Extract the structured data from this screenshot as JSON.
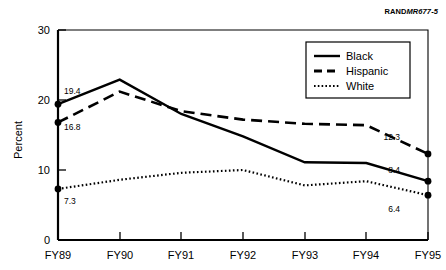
{
  "source_tag": {
    "prefix": "RAND",
    "code": "MR677-5"
  },
  "chart_data": {
    "type": "line",
    "title": "",
    "subtitle": "",
    "xlabel": "",
    "ylabel": "Percent",
    "categories": [
      "FY89",
      "FY90",
      "FY91",
      "FY92",
      "FY93",
      "FY94",
      "FY95"
    ],
    "ylim": [
      0,
      30
    ],
    "yticks": [
      0,
      10,
      20,
      30
    ],
    "ytick_labels": [
      "0",
      "10",
      "20",
      "30"
    ],
    "grid": false,
    "legend_position": "top-right",
    "series": [
      {
        "name": "Black",
        "style": "solid",
        "values": [
          19.4,
          22.9,
          18.0,
          14.8,
          11.1,
          11.0,
          8.4
        ],
        "start_label": "19.4",
        "end_label": "8.4"
      },
      {
        "name": "Hispanic",
        "style": "dashed",
        "values": [
          16.8,
          21.2,
          18.4,
          17.2,
          16.6,
          16.4,
          12.3
        ],
        "start_label": "16.8",
        "end_label": "12.3"
      },
      {
        "name": "White",
        "style": "dotted",
        "values": [
          7.3,
          8.6,
          9.6,
          10.0,
          7.8,
          8.4,
          6.4
        ],
        "start_label": "7.3",
        "end_label": "6.4"
      }
    ],
    "annotations": [
      {
        "text": "19.4",
        "series": "Black",
        "position": "start"
      },
      {
        "text": "16.8",
        "series": "Hispanic",
        "position": "start"
      },
      {
        "text": "7.3",
        "series": "White",
        "position": "start"
      },
      {
        "text": "12.3",
        "series": "Hispanic",
        "position": "end"
      },
      {
        "text": "8.4",
        "series": "Black",
        "position": "end"
      },
      {
        "text": "6.4",
        "series": "White",
        "position": "end"
      }
    ]
  }
}
